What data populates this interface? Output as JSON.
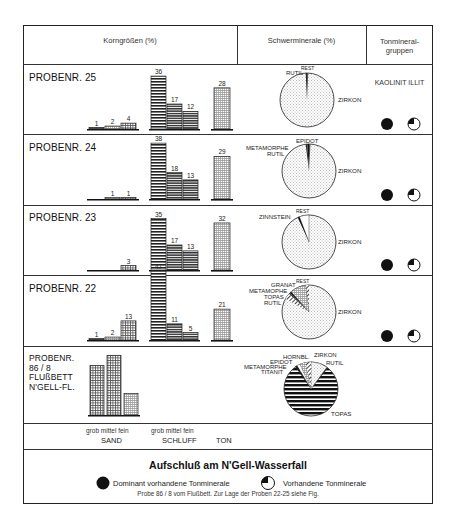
{
  "header": {
    "col1": "Korngrößen (%)",
    "col2": "Schwerminerale (%)",
    "col3_line1": "Tonmineral-",
    "col3_line2": "gruppen"
  },
  "clay_groups_header": "KAOLINIT  ILLIT",
  "rows": [
    {
      "label": "PROBENR. 25"
    },
    {
      "label": "PROBENR. 24"
    },
    {
      "label": "PROBENR. 23"
    },
    {
      "label": "PROBENR. 22"
    },
    {
      "label_lines": [
        "PROBENR.",
        "86 / 8",
        "FLUßBETT",
        "N'GELL-FL."
      ]
    }
  ],
  "axis": {
    "sand_sub": "grob mittel fein",
    "silt_sub": "grob mittel fein",
    "sand": "SAND",
    "silt": "SCHLUFF",
    "clay": "TON"
  },
  "title": "Aufschluß am N'Gell-Wasserfall",
  "legend": {
    "dominant": "Dominant vorhandene Tonminerale",
    "present": "Vorhandene Tonminerale"
  },
  "note": "Probe 86 / 8 vom Flußbett. Zur Lage der Proben 22-25 siehe Fig.",
  "chart_data": [
    {
      "type": "bar",
      "title": "Korngrößen (%) — PROBENR. 25",
      "categories": [
        "Sand grob",
        "Sand mittel",
        "Sand fein",
        "Schluff grob",
        "Schluff mittel",
        "Schluff fein",
        "Ton"
      ],
      "values": [
        1,
        2,
        4,
        36,
        17,
        12,
        28
      ]
    },
    {
      "type": "bar",
      "title": "Korngrößen (%) — PROBENR. 24",
      "categories": [
        "Sand grob",
        "Sand mittel",
        "Sand fein",
        "Schluff grob",
        "Schluff mittel",
        "Schluff fein",
        "Ton"
      ],
      "values": [
        0,
        1,
        1,
        38,
        18,
        13,
        29
      ]
    },
    {
      "type": "bar",
      "title": "Korngrößen (%) — PROBENR. 23",
      "categories": [
        "Sand grob",
        "Sand mittel",
        "Sand fein",
        "Schluff grob",
        "Schluff mittel",
        "Schluff fein",
        "Ton"
      ],
      "values": [
        0,
        0,
        3,
        35,
        17,
        13,
        32
      ]
    },
    {
      "type": "bar",
      "title": "Korngrößen (%) — PROBENR. 22",
      "categories": [
        "Sand grob",
        "Sand mittel",
        "Sand fein",
        "Schluff grob",
        "Schluff mittel",
        "Schluff fein",
        "Ton"
      ],
      "values": [
        1,
        2,
        13,
        47,
        11,
        5,
        21
      ]
    },
    {
      "type": "bar",
      "title": "Korngrößen (%) — PROBENR. 86/8 Flußbett N'Gell-Fl.",
      "categories": [
        "Sand grob",
        "Sand mittel",
        "Sand fein"
      ],
      "values": [
        39,
        47,
        17
      ],
      "note": "values estimated, no data labels shown"
    },
    {
      "type": "pie",
      "title": "Schwerminerale (%) — PROBENR. 25",
      "labels": [
        "ZIRKON",
        "RUTIL",
        "REST"
      ],
      "values": [
        98,
        1,
        1
      ]
    },
    {
      "type": "pie",
      "title": "Schwerminerale (%) — PROBENR. 24",
      "labels": [
        "ZIRKON",
        "RUTIL",
        "METAMORPHE",
        "EPIDOT"
      ],
      "values": [
        97,
        1,
        1,
        1
      ]
    },
    {
      "type": "pie",
      "title": "Schwerminerale (%) — PROBENR. 23",
      "labels": [
        "ZIRKON",
        "ZINNSTEIN",
        "REST"
      ],
      "values": [
        93,
        1,
        6
      ]
    },
    {
      "type": "pie",
      "title": "Schwerminerale (%) — PROBENR. 22",
      "labels": [
        "ZIRKON",
        "RUTIL",
        "TOPAS",
        "METAMORPHE",
        "GRANAT",
        "REST"
      ],
      "values": [
        82,
        3,
        1,
        1,
        11,
        2
      ]
    },
    {
      "type": "pie",
      "title": "Schwerminerale (%) — PROBENR. 86/8",
      "labels": [
        "TOPAS",
        "TITANIT",
        "METAMORPHE",
        "EPIDOT",
        "HORNBL.",
        "ZIRKON",
        "RUTIL"
      ],
      "values": [
        84,
        1,
        1,
        1,
        3,
        9,
        1
      ]
    },
    {
      "type": "table",
      "title": "Tonmineralgruppen",
      "columns": [
        "KAOLINIT",
        "ILLIT"
      ],
      "rows": [
        {
          "sample": "25",
          "KAOLINIT": "dominant",
          "ILLIT": "vorhanden"
        },
        {
          "sample": "24",
          "KAOLINIT": "dominant",
          "ILLIT": "vorhanden"
        },
        {
          "sample": "23",
          "KAOLINIT": "dominant",
          "ILLIT": "vorhanden"
        },
        {
          "sample": "22",
          "KAOLINIT": "dominant",
          "ILLIT": "vorhanden"
        }
      ]
    }
  ]
}
